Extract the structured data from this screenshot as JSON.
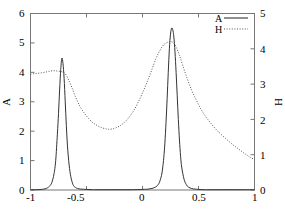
{
  "chart_data": {
    "type": "line",
    "title": "",
    "xlabel": "",
    "ylabel": "A",
    "y2label": "H",
    "xlim": [
      -1,
      1
    ],
    "ylim": [
      0,
      6
    ],
    "y2lim": [
      0,
      5
    ],
    "grid": false,
    "legend_position": "top-right",
    "xticks": [
      -1,
      -0.5,
      0,
      0.5,
      1
    ],
    "xtick_labels": [
      "-1",
      "-0.5",
      "0",
      "0.5",
      "1"
    ],
    "yticks": [
      0,
      1,
      2,
      3,
      4,
      5,
      6
    ],
    "ytick_labels": [
      "0",
      "1",
      "2",
      "3",
      "4",
      "5",
      "6"
    ],
    "y2ticks": [
      0,
      1,
      2,
      3,
      4,
      5
    ],
    "y2tick_labels": [
      "0",
      "1",
      "2",
      "3",
      "4",
      "5"
    ],
    "series": [
      {
        "name": "A",
        "axis": "left",
        "style": "solid",
        "color": "#000000",
        "peaks": [
          {
            "center": -0.72,
            "height": 4.48,
            "width": 0.045
          },
          {
            "center": 0.26,
            "height": 5.5,
            "width": 0.055
          }
        ],
        "x": [
          -1.0,
          -0.95,
          -0.9,
          -0.87,
          -0.85,
          -0.83,
          -0.81,
          -0.79,
          -0.775,
          -0.76,
          -0.75,
          -0.74,
          -0.73,
          -0.72,
          -0.71,
          -0.7,
          -0.69,
          -0.68,
          -0.67,
          -0.655,
          -0.64,
          -0.62,
          -0.6,
          -0.58,
          -0.55,
          -0.5,
          -0.45,
          -0.4,
          -0.3,
          -0.2,
          -0.1,
          0.0,
          0.05,
          0.1,
          0.13,
          0.15,
          0.17,
          0.18,
          0.19,
          0.2,
          0.21,
          0.22,
          0.23,
          0.24,
          0.25,
          0.26,
          0.27,
          0.28,
          0.29,
          0.3,
          0.31,
          0.32,
          0.33,
          0.34,
          0.35,
          0.37,
          0.39,
          0.41,
          0.44,
          0.47,
          0.5,
          0.55,
          0.6,
          0.7,
          0.8,
          0.9,
          1.0
        ],
        "y": [
          0.01,
          0.01,
          0.02,
          0.04,
          0.07,
          0.13,
          0.25,
          0.55,
          1.0,
          1.9,
          2.6,
          3.4,
          4.1,
          4.48,
          4.3,
          3.8,
          3.0,
          2.2,
          1.5,
          0.85,
          0.45,
          0.18,
          0.09,
          0.05,
          0.03,
          0.02,
          0.01,
          0.01,
          0.01,
          0.01,
          0.01,
          0.02,
          0.03,
          0.07,
          0.14,
          0.25,
          0.5,
          0.75,
          1.1,
          1.6,
          2.3,
          3.1,
          4.0,
          4.8,
          5.3,
          5.5,
          5.45,
          5.2,
          4.7,
          4.0,
          3.2,
          2.4,
          1.7,
          1.15,
          0.78,
          0.38,
          0.19,
          0.1,
          0.05,
          0.03,
          0.02,
          0.01,
          0.01,
          0.01,
          0.01,
          0.01,
          0.01
        ]
      },
      {
        "name": "H",
        "axis": "right",
        "style": "dotted",
        "color": "#000000",
        "x": [
          -1.0,
          -0.95,
          -0.9,
          -0.85,
          -0.82,
          -0.79,
          -0.76,
          -0.74,
          -0.72,
          -0.7,
          -0.68,
          -0.66,
          -0.63,
          -0.6,
          -0.56,
          -0.52,
          -0.48,
          -0.44,
          -0.4,
          -0.36,
          -0.32,
          -0.3,
          -0.27,
          -0.24,
          -0.2,
          -0.16,
          -0.12,
          -0.08,
          -0.04,
          0.0,
          0.04,
          0.08,
          0.12,
          0.15,
          0.18,
          0.2,
          0.22,
          0.24,
          0.26,
          0.28,
          0.3,
          0.33,
          0.36,
          0.4,
          0.44,
          0.48,
          0.52,
          0.56,
          0.6,
          0.65,
          0.7,
          0.75,
          0.8,
          0.85,
          0.9,
          0.95,
          1.0
        ],
        "y": [
          3.28,
          3.3,
          3.32,
          3.35,
          3.37,
          3.38,
          3.37,
          3.36,
          3.35,
          3.32,
          3.25,
          3.12,
          2.9,
          2.65,
          2.38,
          2.18,
          2.02,
          1.9,
          1.82,
          1.76,
          1.73,
          1.72,
          1.73,
          1.76,
          1.82,
          1.92,
          2.06,
          2.24,
          2.48,
          2.75,
          3.05,
          3.38,
          3.72,
          3.92,
          4.08,
          4.14,
          4.18,
          4.2,
          4.2,
          4.16,
          4.05,
          3.82,
          3.52,
          3.15,
          2.82,
          2.55,
          2.3,
          2.1,
          1.93,
          1.74,
          1.58,
          1.44,
          1.3,
          1.18,
          1.06,
          0.95,
          0.86
        ]
      }
    ]
  },
  "legend": {
    "entries": [
      {
        "label": "A",
        "style": "solid"
      },
      {
        "label": "H",
        "style": "dotted"
      }
    ]
  },
  "axes": {
    "left_title": "A",
    "right_title": "H"
  }
}
